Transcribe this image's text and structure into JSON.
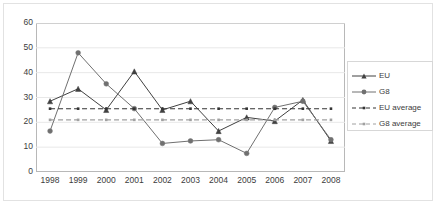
{
  "chart_data": {
    "type": "line",
    "title": "",
    "xlabel": "",
    "ylabel": "",
    "categories": [
      "1998",
      "1999",
      "2000",
      "2001",
      "2002",
      "2003",
      "2004",
      "2005",
      "2006",
      "2007",
      "2008"
    ],
    "ylim": [
      0,
      60
    ],
    "ytick_labels": [
      "0",
      "10",
      "20",
      "30",
      "40",
      "50",
      "60"
    ],
    "ytick_values": [
      0,
      10,
      20,
      30,
      40,
      50,
      60
    ],
    "grid": "horizontal",
    "legend_position": "right",
    "series": [
      {
        "name": "EU",
        "style": "solid",
        "marker": "triangle",
        "color": "#404040",
        "values": [
          28.5,
          33.5,
          25.0,
          40.5,
          25.0,
          28.5,
          16.5,
          22.0,
          20.5,
          29.0,
          12.5
        ]
      },
      {
        "name": "G8",
        "style": "solid",
        "marker": "circle",
        "color": "#707070",
        "values": [
          16.5,
          48.0,
          35.5,
          25.5,
          11.5,
          12.5,
          13.0,
          7.5,
          26.0,
          28.5,
          13.0
        ]
      },
      {
        "name": "EU average",
        "style": "dashed",
        "marker": "small-square",
        "color": "#333333",
        "constant": 25.5,
        "values": [
          25.5,
          25.5,
          25.5,
          25.5,
          25.5,
          25.5,
          25.5,
          25.5,
          25.5,
          25.5,
          25.5
        ]
      },
      {
        "name": "G8 average",
        "style": "dashed",
        "marker": "small-square",
        "color": "#a0a0a0",
        "constant": 21.0,
        "values": [
          21.0,
          21.0,
          21.0,
          21.0,
          21.0,
          21.0,
          21.0,
          21.0,
          21.0,
          21.0,
          21.0
        ]
      }
    ]
  },
  "legend": {
    "items": [
      {
        "label": "EU"
      },
      {
        "label": "G8"
      },
      {
        "label": "EU average"
      },
      {
        "label": "G8 average"
      }
    ]
  }
}
